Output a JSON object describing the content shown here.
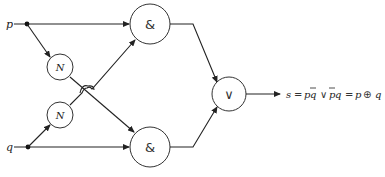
{
  "diagram": {
    "type": "logic-circuit",
    "inputs": [
      {
        "id": "p",
        "label": "p"
      },
      {
        "id": "q",
        "label": "q"
      }
    ],
    "gates": [
      {
        "id": "not_top",
        "type": "NOT",
        "symbol": "N",
        "input": "p"
      },
      {
        "id": "not_bottom",
        "type": "NOT",
        "symbol": "N",
        "input": "q"
      },
      {
        "id": "and_top",
        "type": "AND",
        "symbol": "&",
        "inputs": [
          "p",
          "not_bottom"
        ]
      },
      {
        "id": "and_bottom",
        "type": "AND",
        "symbol": "&",
        "inputs": [
          "not_top",
          "q"
        ]
      },
      {
        "id": "or",
        "type": "OR",
        "symbol": "∨",
        "inputs": [
          "and_top",
          "and_bottom"
        ]
      }
    ],
    "output": {
      "label": "s",
      "expression_parts": [
        "s",
        "=",
        "p",
        "q",
        "∨",
        "p",
        "q",
        "=",
        "p",
        "⊕",
        "q"
      ],
      "expression_text": "s = pq̄ ∨ p̄q = p ⊕ q"
    },
    "crossover": "wire hop where not_top output crosses not_bottom output"
  }
}
